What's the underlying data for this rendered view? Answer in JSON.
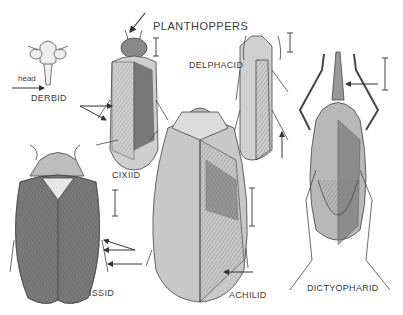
{
  "figure": {
    "title": "PLANTHOPPERS",
    "labels": {
      "derbid": "DERBID",
      "head": "head",
      "cixiid": "CIXIID",
      "delphacid": "DELPHACID",
      "issid": "ISSID",
      "achilid": "ACHILID",
      "dictyopharid": "DICTYOPHARID"
    },
    "colors": {
      "ink": "#3a3a3a",
      "body_light": "#d8d8d8",
      "body_mid": "#a8a8a8",
      "body_dark": "#6e6e6e",
      "background": "#ffffff"
    }
  }
}
